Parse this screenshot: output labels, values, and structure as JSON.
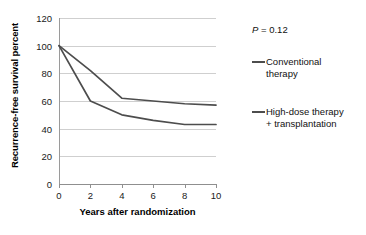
{
  "chart_data": {
    "type": "line",
    "title": "",
    "xlabel": "Years after randomization",
    "ylabel": "Recurrence-free survival percent",
    "xlim": [
      0,
      10
    ],
    "ylim": [
      0,
      120
    ],
    "xticks": [
      0,
      2,
      4,
      6,
      8,
      10
    ],
    "yticks": [
      0,
      20,
      40,
      60,
      80,
      100,
      120
    ],
    "grid": "horizontal",
    "legend_position": "right",
    "annotations": [
      {
        "text": "P = 0.12",
        "italic_part": "P",
        "rest": " = 0.12"
      }
    ],
    "x": [
      0,
      2,
      4,
      6,
      8,
      10
    ],
    "series": [
      {
        "name": "Conventional therapy",
        "color": "#4d4d4d",
        "values": [
          100,
          82,
          62,
          60,
          58,
          57
        ]
      },
      {
        "name": "High-dose therapy + transplantation",
        "color": "#4d4d4d",
        "values": [
          100,
          60,
          50,
          46,
          43,
          43
        ]
      }
    ]
  },
  "axes": {
    "ylabel": "Recurrence-free survival percent",
    "xlabel": "Years after randomization",
    "ytick_labels": [
      "120",
      "100",
      "80",
      "60",
      "40",
      "20",
      "0"
    ],
    "xtick_labels": [
      "0",
      "2",
      "4",
      "6",
      "8",
      "10"
    ]
  },
  "annotation": {
    "p_symbol": "P",
    "p_rest": " = 0.12",
    "full": "P = 0.12"
  },
  "legend": {
    "items": [
      {
        "label": "Conventional therapy"
      },
      {
        "label": "High-dose therapy + transplantation"
      }
    ]
  },
  "colors": {
    "line": "#4d4d4d",
    "grid": "#cfcfcf",
    "axis": "#8f8f8f",
    "text": "#111111",
    "background": "#ffffff"
  }
}
